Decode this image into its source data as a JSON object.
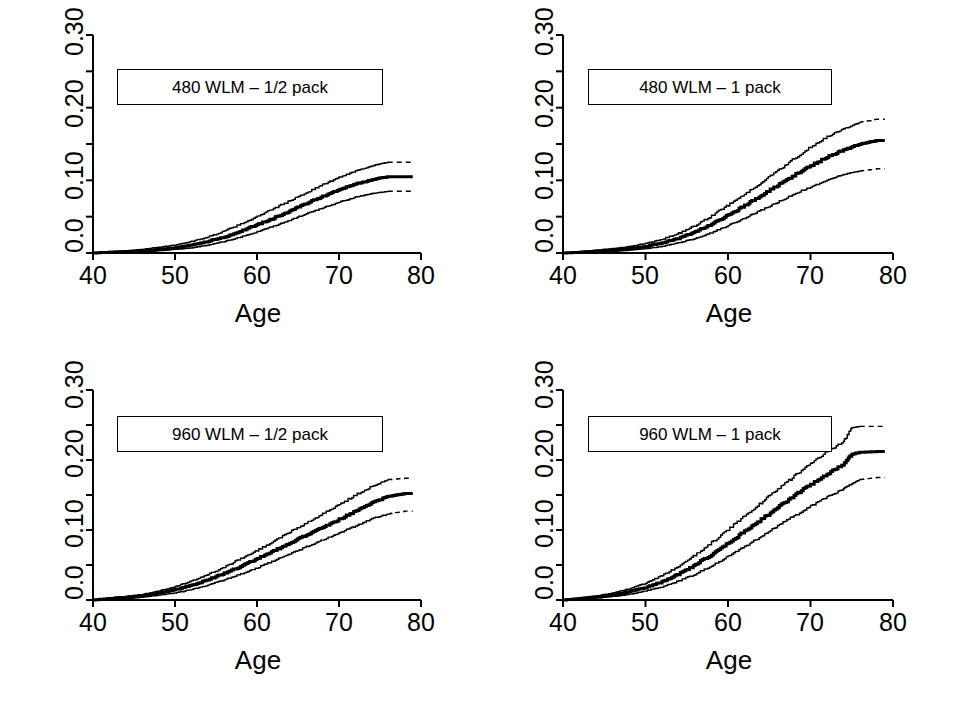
{
  "figure": {
    "background": "#ffffff",
    "ink": "#000000",
    "layout": "2x2 panel grid",
    "panel_count": 4
  },
  "chart_data": [
    {
      "type": "line",
      "id": "panel-480-half-pack",
      "position": "top-left",
      "title": "",
      "annotation": "480 WLM – 1/2 pack",
      "xlabel": "Age",
      "ylabel": "",
      "xlim": [
        40,
        80
      ],
      "ylim": [
        0.0,
        0.3
      ],
      "xticks": [
        40,
        50,
        60,
        70,
        80
      ],
      "xticklabels": [
        "40",
        "50",
        "60",
        "70",
        "80"
      ],
      "yticks": [
        0.0,
        0.05,
        0.1,
        0.15,
        0.2,
        0.25,
        0.3
      ],
      "yticklabels": [
        "0.0",
        "",
        "0.10",
        "",
        "0.20",
        "",
        "0.30"
      ],
      "grid": false,
      "legend": "none",
      "x": [
        40,
        42,
        44,
        46,
        48,
        50,
        52,
        54,
        56,
        58,
        60,
        62,
        64,
        66,
        68,
        70,
        72,
        74,
        76,
        78,
        79
      ],
      "series": [
        {
          "name": "upper 95% CI",
          "style": "thin-solid-then-dashed",
          "dash_from_x": 76,
          "values": [
            0.0,
            0.002,
            0.003,
            0.005,
            0.008,
            0.011,
            0.016,
            0.022,
            0.03,
            0.04,
            0.05,
            0.061,
            0.072,
            0.083,
            0.094,
            0.104,
            0.113,
            0.12,
            0.125,
            0.125,
            0.125
          ]
        },
        {
          "name": "estimate",
          "style": "thick-solid",
          "dash_from_x": null,
          "values": [
            0.0,
            0.001,
            0.002,
            0.003,
            0.005,
            0.007,
            0.011,
            0.016,
            0.022,
            0.03,
            0.039,
            0.048,
            0.058,
            0.068,
            0.078,
            0.087,
            0.095,
            0.101,
            0.105,
            0.105,
            0.105
          ]
        },
        {
          "name": "lower 95% CI",
          "style": "thin-solid-then-dashed",
          "dash_from_x": 76,
          "values": [
            0.0,
            0.001,
            0.001,
            0.002,
            0.003,
            0.005,
            0.007,
            0.011,
            0.016,
            0.022,
            0.029,
            0.037,
            0.045,
            0.054,
            0.062,
            0.07,
            0.077,
            0.082,
            0.085,
            0.085,
            0.085
          ]
        }
      ]
    },
    {
      "type": "line",
      "id": "panel-480-one-pack",
      "position": "top-right",
      "title": "",
      "annotation": "480 WLM – 1 pack",
      "xlabel": "Age",
      "ylabel": "",
      "xlim": [
        40,
        80
      ],
      "ylim": [
        0.0,
        0.3
      ],
      "xticks": [
        40,
        50,
        60,
        70,
        80
      ],
      "xticklabels": [
        "40",
        "50",
        "60",
        "70",
        "80"
      ],
      "yticks": [
        0.0,
        0.05,
        0.1,
        0.15,
        0.2,
        0.25,
        0.3
      ],
      "yticklabels": [
        "0.0",
        "",
        "0.10",
        "",
        "0.20",
        "",
        "0.30"
      ],
      "grid": false,
      "legend": "none",
      "x": [
        40,
        42,
        44,
        46,
        48,
        50,
        52,
        54,
        56,
        58,
        60,
        62,
        64,
        66,
        68,
        70,
        72,
        74,
        76,
        78,
        79
      ],
      "series": [
        {
          "name": "upper 95% CI",
          "style": "thin-solid-then-dashed",
          "dash_from_x": 76,
          "values": [
            0.0,
            0.002,
            0.004,
            0.006,
            0.009,
            0.013,
            0.019,
            0.027,
            0.038,
            0.051,
            0.066,
            0.081,
            0.097,
            0.113,
            0.13,
            0.146,
            0.16,
            0.171,
            0.18,
            0.184,
            0.184
          ]
        },
        {
          "name": "estimate",
          "style": "thick-solid",
          "dash_from_x": null,
          "values": [
            0.0,
            0.001,
            0.002,
            0.004,
            0.006,
            0.009,
            0.014,
            0.02,
            0.029,
            0.04,
            0.052,
            0.065,
            0.079,
            0.093,
            0.107,
            0.12,
            0.132,
            0.142,
            0.15,
            0.155,
            0.155
          ]
        },
        {
          "name": "lower 95% CI",
          "style": "thin-solid-then-dashed",
          "dash_from_x": 76,
          "values": [
            0.0,
            0.001,
            0.001,
            0.002,
            0.004,
            0.006,
            0.009,
            0.014,
            0.02,
            0.028,
            0.038,
            0.048,
            0.059,
            0.07,
            0.081,
            0.091,
            0.1,
            0.108,
            0.113,
            0.116,
            0.116
          ]
        }
      ]
    },
    {
      "type": "line",
      "id": "panel-960-half-pack",
      "position": "bottom-left",
      "title": "",
      "annotation": "960 WLM – 1/2 pack",
      "xlabel": "Age",
      "ylabel": "",
      "xlim": [
        40,
        80
      ],
      "ylim": [
        0.0,
        0.3
      ],
      "xticks": [
        40,
        50,
        60,
        70,
        80
      ],
      "xticklabels": [
        "40",
        "50",
        "60",
        "70",
        "80"
      ],
      "yticks": [
        0.0,
        0.05,
        0.1,
        0.15,
        0.2,
        0.25,
        0.3
      ],
      "yticklabels": [
        "0.0",
        "",
        "0.10",
        "",
        "0.20",
        "",
        "0.30"
      ],
      "grid": false,
      "legend": "none",
      "x": [
        40,
        42,
        44,
        46,
        48,
        50,
        52,
        54,
        56,
        58,
        60,
        62,
        64,
        66,
        68,
        70,
        72,
        74,
        76,
        78,
        79
      ],
      "series": [
        {
          "name": "upper 95% CI",
          "style": "thin-solid-then-dashed",
          "dash_from_x": 76,
          "values": [
            0.0,
            0.003,
            0.005,
            0.008,
            0.013,
            0.019,
            0.027,
            0.036,
            0.047,
            0.059,
            0.071,
            0.084,
            0.097,
            0.11,
            0.123,
            0.136,
            0.15,
            0.162,
            0.172,
            0.174,
            0.174
          ]
        },
        {
          "name": "estimate",
          "style": "thick-solid",
          "dash_from_x": null,
          "values": [
            0.0,
            0.002,
            0.004,
            0.006,
            0.01,
            0.015,
            0.021,
            0.029,
            0.038,
            0.048,
            0.059,
            0.07,
            0.081,
            0.093,
            0.104,
            0.115,
            0.127,
            0.139,
            0.148,
            0.152,
            0.152
          ]
        },
        {
          "name": "lower 95% CI",
          "style": "thin-solid-then-dashed",
          "dash_from_x": 76,
          "values": [
            0.0,
            0.001,
            0.002,
            0.004,
            0.007,
            0.01,
            0.015,
            0.021,
            0.029,
            0.037,
            0.046,
            0.056,
            0.066,
            0.076,
            0.086,
            0.096,
            0.106,
            0.116,
            0.123,
            0.127,
            0.127
          ]
        }
      ]
    },
    {
      "type": "line",
      "id": "panel-960-one-pack",
      "position": "bottom-right",
      "title": "",
      "annotation": "960 WLM – 1 pack",
      "xlabel": "Age",
      "ylabel": "",
      "xlim": [
        40,
        80
      ],
      "ylim": [
        0.0,
        0.3
      ],
      "xticks": [
        40,
        50,
        60,
        70,
        80
      ],
      "xticklabels": [
        "40",
        "50",
        "60",
        "70",
        "80"
      ],
      "yticks": [
        0.0,
        0.05,
        0.1,
        0.15,
        0.2,
        0.25,
        0.3
      ],
      "yticklabels": [
        "0.0",
        "",
        "0.10",
        "",
        "0.20",
        "",
        "0.30"
      ],
      "grid": false,
      "legend": "none",
      "x": [
        40,
        42,
        44,
        46,
        48,
        50,
        52,
        54,
        56,
        58,
        60,
        62,
        64,
        66,
        68,
        70,
        72,
        74,
        75,
        76,
        78,
        79
      ],
      "series": [
        {
          "name": "upper 95% CI",
          "style": "thin-solid-then-dashed-with-step",
          "dash_from_x": 76,
          "values": [
            0.0,
            0.003,
            0.006,
            0.01,
            0.016,
            0.024,
            0.035,
            0.048,
            0.064,
            0.082,
            0.101,
            0.12,
            0.139,
            0.158,
            0.177,
            0.195,
            0.212,
            0.226,
            0.246,
            0.248,
            0.248,
            0.248
          ]
        },
        {
          "name": "estimate",
          "style": "thick-solid",
          "dash_from_x": null,
          "values": [
            0.0,
            0.002,
            0.004,
            0.007,
            0.012,
            0.018,
            0.026,
            0.037,
            0.05,
            0.065,
            0.081,
            0.098,
            0.115,
            0.132,
            0.149,
            0.165,
            0.18,
            0.194,
            0.208,
            0.211,
            0.212,
            0.212
          ]
        },
        {
          "name": "lower 95% CI",
          "style": "thin-solid-then-dashed",
          "dash_from_x": 76,
          "values": [
            0.0,
            0.001,
            0.003,
            0.005,
            0.008,
            0.013,
            0.019,
            0.027,
            0.037,
            0.049,
            0.062,
            0.076,
            0.091,
            0.106,
            0.12,
            0.134,
            0.147,
            0.159,
            0.166,
            0.172,
            0.175,
            0.175
          ]
        }
      ]
    }
  ],
  "panels": [
    {
      "id": "panel-480-half-pack",
      "legend_label": "480 WLM – 1/2 pack",
      "xaxis_title": "Age",
      "xtick_labels": [
        "40",
        "50",
        "60",
        "70",
        "80"
      ],
      "ytick_labels": [
        "0.0",
        "0.10",
        "0.20",
        "0.30"
      ]
    },
    {
      "id": "panel-480-one-pack",
      "legend_label": "480 WLM – 1 pack",
      "xaxis_title": "Age",
      "xtick_labels": [
        "40",
        "50",
        "60",
        "70",
        "80"
      ],
      "ytick_labels": [
        "0.0",
        "0.10",
        "0.20",
        "0.30"
      ]
    },
    {
      "id": "panel-960-half-pack",
      "legend_label": "960 WLM – 1/2 pack",
      "xaxis_title": "Age",
      "xtick_labels": [
        "40",
        "50",
        "60",
        "70",
        "80"
      ],
      "ytick_labels": [
        "0.0",
        "0.10",
        "0.20",
        "0.30"
      ]
    },
    {
      "id": "panel-960-one-pack",
      "legend_label": "960 WLM – 1 pack",
      "xaxis_title": "Age",
      "xtick_labels": [
        "40",
        "50",
        "60",
        "70",
        "80"
      ],
      "ytick_labels": [
        "0.0",
        "0.10",
        "0.20",
        "0.30"
      ]
    }
  ]
}
